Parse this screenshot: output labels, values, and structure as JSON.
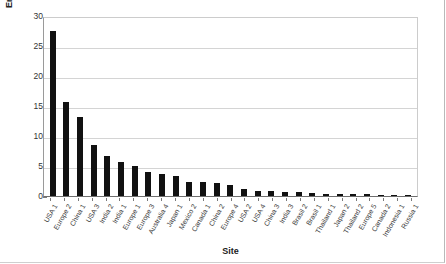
{
  "chart_data": {
    "type": "bar",
    "title": "",
    "xlabel": "Site",
    "ylabel": "Energy consumption [%]",
    "ylim": [
      0,
      30
    ],
    "yticks": [
      0,
      5,
      10,
      15,
      20,
      25,
      30
    ],
    "grid": true,
    "legend": null,
    "bar_color": "#111111",
    "grid_color": "#d4d4d4",
    "categories": [
      "USA 1",
      "Europe 2",
      "China 1",
      "USA 3",
      "India 2",
      "India 1",
      "Europe 1",
      "Europe 3",
      "Australia 4",
      "Japan 1",
      "Mexico 2",
      "Canada 1",
      "China 2",
      "Europe 4",
      "USA 2",
      "USA 4",
      "China 3",
      "India 3",
      "Brasil 2",
      "Brasil 1",
      "Thailand 1",
      "Japan 2",
      "Thailand 2",
      "Europe 5",
      "Canada 2",
      "Indonesia 1",
      "Russia 1"
    ],
    "values": [
      27.5,
      15.6,
      13.2,
      8.5,
      6.7,
      5.7,
      5.0,
      4.0,
      3.7,
      3.3,
      2.4,
      2.3,
      2.2,
      1.9,
      1.1,
      0.8,
      0.8,
      0.7,
      0.7,
      0.45,
      0.4,
      0.4,
      0.35,
      0.3,
      0.25,
      0.2,
      0.15
    ]
  },
  "axis": {
    "y_title": "Energy consumption [%]",
    "x_title": "Site",
    "y_tick_labels": [
      "30",
      "25",
      "20",
      "15",
      "10",
      "5",
      "0"
    ]
  }
}
